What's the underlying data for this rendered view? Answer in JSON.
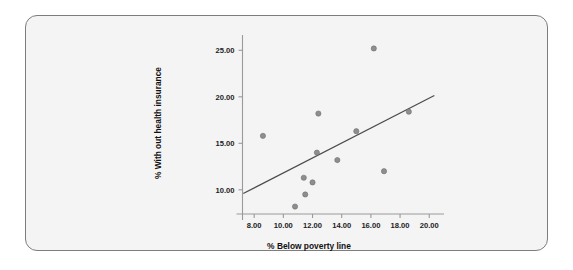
{
  "chart_data": {
    "type": "scatter",
    "title": "",
    "xlabel": "% Below poverty line",
    "ylabel": "% With out health insurance",
    "xlim": [
      7.2,
      20.6
    ],
    "ylim": [
      7.4,
      26.0
    ],
    "xticks": [
      "8.00",
      "10.00",
      "12.00",
      "14.00",
      "16.00",
      "18.00",
      "20.00"
    ],
    "xtick_values": [
      8,
      10,
      12,
      14,
      16,
      18,
      20
    ],
    "yticks": [
      "10.00",
      "15.00",
      "20.00",
      "25.00"
    ],
    "ytick_values": [
      10,
      15,
      20,
      25
    ],
    "grid": false,
    "legend": "none",
    "marker_color": "#8e8e8e",
    "fit_line_color": "#4b4b4b",
    "points": [
      {
        "x": 8.6,
        "y": 15.8
      },
      {
        "x": 10.8,
        "y": 8.2
      },
      {
        "x": 11.4,
        "y": 11.3
      },
      {
        "x": 11.5,
        "y": 9.5
      },
      {
        "x": 12.0,
        "y": 10.8
      },
      {
        "x": 12.3,
        "y": 14.0
      },
      {
        "x": 12.4,
        "y": 18.2
      },
      {
        "x": 13.7,
        "y": 13.2
      },
      {
        "x": 15.0,
        "y": 16.3
      },
      {
        "x": 16.2,
        "y": 25.2
      },
      {
        "x": 16.9,
        "y": 12.0
      },
      {
        "x": 18.6,
        "y": 18.4
      }
    ],
    "fit_line": {
      "x0": 7.25,
      "y0": 9.6,
      "x1": 20.35,
      "y1": 20.15
    }
  },
  "figure": {
    "background": "#f4f4f4",
    "border_color": "#7d7d7d"
  }
}
